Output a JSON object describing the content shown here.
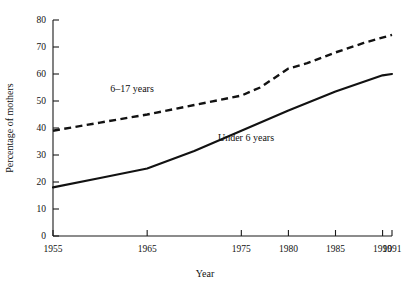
{
  "chart_data": {
    "type": "line",
    "title": "",
    "xlabel": "Year",
    "ylabel": "Percentage of mothers",
    "xlim": [
      1955,
      1991
    ],
    "ylim": [
      0,
      80
    ],
    "grid": false,
    "legend_position": "inline-annotations",
    "y_ticks": [
      0,
      10,
      20,
      30,
      40,
      50,
      60,
      70,
      80
    ],
    "y_tick_labels": [
      "0",
      "10",
      "20",
      "30",
      "40",
      "50",
      "60",
      "70",
      "80"
    ],
    "x_ticks": [
      1955,
      1965,
      1975,
      1980,
      1985,
      1990,
      1991
    ],
    "x_tick_labels": [
      "1955",
      "1965",
      "1975",
      "1980",
      "1985",
      "1990",
      "1991"
    ],
    "series": [
      {
        "name": "6–17 years",
        "style": "dashed",
        "color": "#121212",
        "label_text": "6–17 years",
        "x": [
          1955,
          1960,
          1965,
          1970,
          1975,
          1977,
          1980,
          1982,
          1985,
          1988,
          1991
        ],
        "values": [
          39,
          42,
          45,
          48.5,
          52,
          55,
          62,
          64,
          68,
          71.5,
          74.5
        ]
      },
      {
        "name": "Under 6 years",
        "style": "solid",
        "color": "#121212",
        "label_text": "Under 6 years",
        "x": [
          1955,
          1960,
          1965,
          1970,
          1975,
          1980,
          1985,
          1990,
          1991
        ],
        "values": [
          18,
          21.5,
          25,
          31.5,
          39,
          46.5,
          53.5,
          59.5,
          60
        ]
      }
    ],
    "annotations": [
      {
        "text": "6–17 years",
        "x_px": 132,
        "y_px": 92
      },
      {
        "text": "Under 6 years",
        "x_px": 246,
        "y_px": 141
      }
    ]
  }
}
